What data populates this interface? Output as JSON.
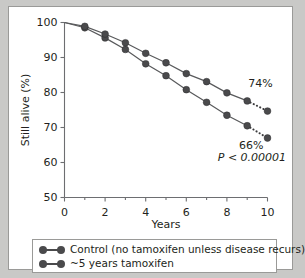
{
  "chart_data": {
    "type": "line",
    "title": "",
    "xlabel": "Years",
    "ylabel": "Still alive (%)",
    "xlim": [
      0,
      10
    ],
    "ylim": [
      50,
      100
    ],
    "xticks": [
      0,
      2,
      4,
      6,
      8,
      10
    ],
    "xtick_labels": [
      "0",
      "2",
      "4",
      "6",
      "8",
      "10"
    ],
    "xminorticks": [
      1,
      3,
      5,
      7,
      9
    ],
    "yticks": [
      50,
      60,
      70,
      80,
      90,
      100
    ],
    "ytick_labels": [
      "50",
      "60",
      "70",
      "80",
      "90",
      "100"
    ],
    "grid": false,
    "legend_position": "below",
    "x": [
      0,
      1,
      2,
      3,
      4,
      5,
      6,
      7,
      8,
      9,
      10
    ],
    "series": [
      {
        "name": "Control (no tamoxifen unless disease recurs)",
        "values": [
          100,
          98.5,
          95.6,
          92.3,
          88.2,
          84.8,
          80.8,
          77.2,
          73.5,
          70.5,
          67.0
        ],
        "color": "#4a4a4c",
        "dotted_from_index": 9,
        "end_label": "66%"
      },
      {
        "name": "~5 years tamoxifen",
        "values": [
          100,
          98.9,
          96.7,
          94.2,
          91.2,
          88.5,
          85.4,
          83.1,
          79.9,
          77.6,
          74.7
        ],
        "color": "#4a4a4c",
        "dotted_from_index": 9,
        "end_label": "74%"
      }
    ],
    "annotations": [
      {
        "text": "74%",
        "x": 9.05,
        "y": 81.5
      },
      {
        "text": "66%",
        "x": 8.6,
        "y": 63.9
      },
      {
        "text": "P < 0.00001",
        "x": 7.55,
        "y": 60.4,
        "italic": true
      }
    ]
  },
  "legend": {
    "items": [
      {
        "label": "Control (no tamoxifen unless disease recurs)"
      },
      {
        "label": "~5 years tamoxifen"
      }
    ]
  }
}
